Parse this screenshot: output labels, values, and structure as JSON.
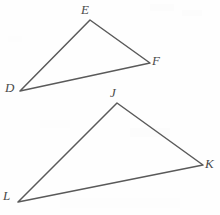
{
  "figure": {
    "background_color": "#fefefe",
    "line_color": "#5a5a5a",
    "label_color": "#4a4a4a",
    "canvas": {
      "width": 220,
      "height": 215
    },
    "triangles": [
      {
        "name": "triangle-def",
        "vertices": [
          {
            "label": "D",
            "x": 20,
            "y": 91,
            "label_x": 5,
            "label_y": 81
          },
          {
            "label": "E",
            "x": 90,
            "y": 20,
            "label_x": 81,
            "label_y": 3
          },
          {
            "label": "F",
            "x": 150,
            "y": 63,
            "label_x": 152,
            "label_y": 54
          }
        ],
        "path": "M 20 91 L 90 20 L 150 63 Z"
      },
      {
        "name": "triangle-jkl",
        "vertices": [
          {
            "label": "J",
            "x": 117,
            "y": 103,
            "label_x": 110,
            "label_y": 86
          },
          {
            "label": "K",
            "x": 203,
            "y": 165,
            "label_x": 205,
            "label_y": 157
          },
          {
            "label": "L",
            "x": 18,
            "y": 202,
            "label_x": 3,
            "label_y": 189
          }
        ],
        "path": "M 117 103 L 203 165 L 18 202 Z"
      }
    ]
  }
}
